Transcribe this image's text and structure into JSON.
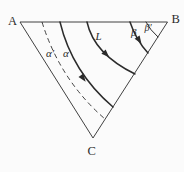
{
  "figure": {
    "type": "ternary-triangle-diagram",
    "colors": {
      "background": "#fbfbfb",
      "line": "#2b2b2b"
    },
    "labels": {
      "A": "A",
      "B": "B",
      "C": "C",
      "L": "L",
      "alpha": "α",
      "alpha_prime": "α′",
      "beta": "β",
      "beta_prime": "β′"
    }
  }
}
